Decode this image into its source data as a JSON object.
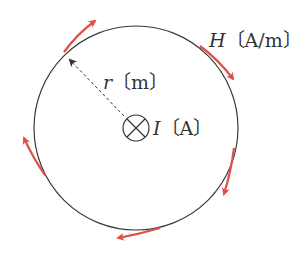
{
  "diagram": {
    "current_symbol": "⊗",
    "labels": {
      "current_var": "I",
      "current_unit": "〔A〕",
      "radius_var": "r",
      "radius_unit": "〔m〕",
      "field_var": "H",
      "field_unit": "〔A/m〕"
    },
    "colors": {
      "circle": "#3a3a3a",
      "arrow": "#e0504a",
      "text": "#333333",
      "dashed": "#333333"
    },
    "field_arrows": [
      {
        "name": "top-left",
        "from": [
          64,
          52
        ],
        "to": [
          95,
          21
        ]
      },
      {
        "name": "top-right",
        "from": [
          200,
          46
        ],
        "to": [
          233,
          79
        ]
      },
      {
        "name": "right",
        "from": [
          234,
          148
        ],
        "to": [
          224,
          194
        ]
      },
      {
        "name": "bottom",
        "from": [
          160,
          228
        ],
        "to": [
          118,
          238
        ]
      },
      {
        "name": "left",
        "from": [
          45,
          175
        ],
        "to": [
          24,
          138
        ]
      }
    ]
  }
}
